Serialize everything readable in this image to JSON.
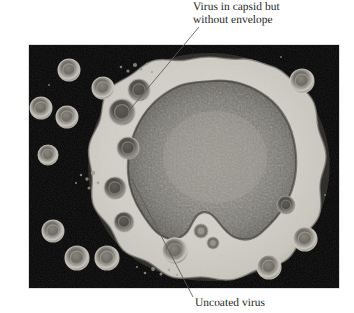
{
  "figure": {
    "background_color": "#ffffff",
    "type": "electron-micrograph"
  },
  "annotations": {
    "top": {
      "text": "Virus in capsid but\nwithout envelope",
      "line_1": "Virus in capsid but",
      "line_2": "without envelope",
      "text_color": "#231f1d",
      "leader": {
        "from_x": 199,
        "from_y": 27,
        "to_x": 127,
        "to_y": 113
      }
    },
    "bottom": {
      "text": "Uncoated virus",
      "line_1": "Uncoated virus",
      "text_color": "#231f1d",
      "leader": {
        "from_x": 131,
        "from_y": 178,
        "to_x": 193,
        "to_y": 297
      }
    }
  },
  "micrograph": {
    "x": 29,
    "y": 45,
    "width": 310,
    "height": 243,
    "background_color": "#000000",
    "border_color": "#c8c8c8",
    "cell": {
      "name": "infected-cell",
      "center_x": 180,
      "center_y": 120,
      "cytoplasm_color": "#d8d6cf",
      "cytoplasm_rim_color": "#8e8c86",
      "nucleus_color": "#9a9790",
      "nucleus_edge_color": "#46443f",
      "notch_description": "indentation at lower-center of nucleus"
    },
    "virus_particles": {
      "ring_color": "#b9b6ae",
      "core_color": "#6a6860",
      "outside_cell": [
        {
          "cx": 40,
          "cy": 25,
          "r": 11
        },
        {
          "cx": 74,
          "cy": 43,
          "r": 11
        },
        {
          "cx": 38,
          "cy": 72,
          "r": 11
        },
        {
          "cx": 12,
          "cy": 63,
          "r": 11
        },
        {
          "cx": 19,
          "cy": 110,
          "r": 10
        },
        {
          "cx": 24,
          "cy": 186,
          "r": 11
        },
        {
          "cx": 48,
          "cy": 213,
          "r": 12
        },
        {
          "cx": 78,
          "cy": 213,
          "r": 12
        },
        {
          "cx": 273,
          "cy": 36,
          "r": 12
        },
        {
          "cx": 276,
          "cy": 194,
          "r": 12
        },
        {
          "cx": 240,
          "cy": 222,
          "r": 12
        }
      ],
      "on_cell_edge": [
        {
          "cx": 110,
          "cy": 45,
          "r": 11
        },
        {
          "cx": 93,
          "cy": 67,
          "r": 13
        },
        {
          "cx": 99,
          "cy": 103,
          "r": 11
        },
        {
          "cx": 86,
          "cy": 143,
          "r": 11
        },
        {
          "cx": 95,
          "cy": 177,
          "r": 10
        },
        {
          "cx": 146,
          "cy": 206,
          "r": 13
        },
        {
          "cx": 257,
          "cy": 160,
          "r": 9
        }
      ],
      "inside_cytoplasm": [
        {
          "cx": 172,
          "cy": 186,
          "r": 7
        },
        {
          "cx": 184,
          "cy": 198,
          "r": 6
        }
      ]
    },
    "debris_clusters": [
      {
        "cx": 112,
        "cy": 22
      },
      {
        "cx": 66,
        "cy": 133
      },
      {
        "cx": 130,
        "cy": 227
      }
    ]
  }
}
